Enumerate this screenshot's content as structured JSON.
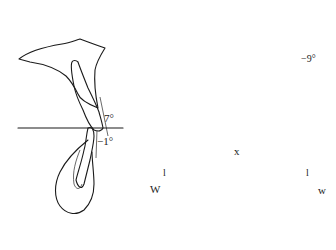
{
  "figure": {
    "panels": [
      {
        "id": "incisor-lateral",
        "description": "Lateral view of upper and lower central incisors with occlusal plane",
        "labels": {
          "upper_angle": "7°",
          "lower_angle": "−1°"
        }
      },
      {
        "id": "molar-frontal",
        "description": "Frontal cross-section of upper molars with palatal vault",
        "labels": {
          "molar_angle": "−9°"
        }
      },
      {
        "id": "arch-occlusal",
        "description": "Occlusal view of lower dental arch with intermolar width",
        "labels": {
          "width_line": "x",
          "left_w": "W",
          "right_w": "w",
          "left_tick": "l",
          "right_tick": "l"
        }
      }
    ]
  }
}
